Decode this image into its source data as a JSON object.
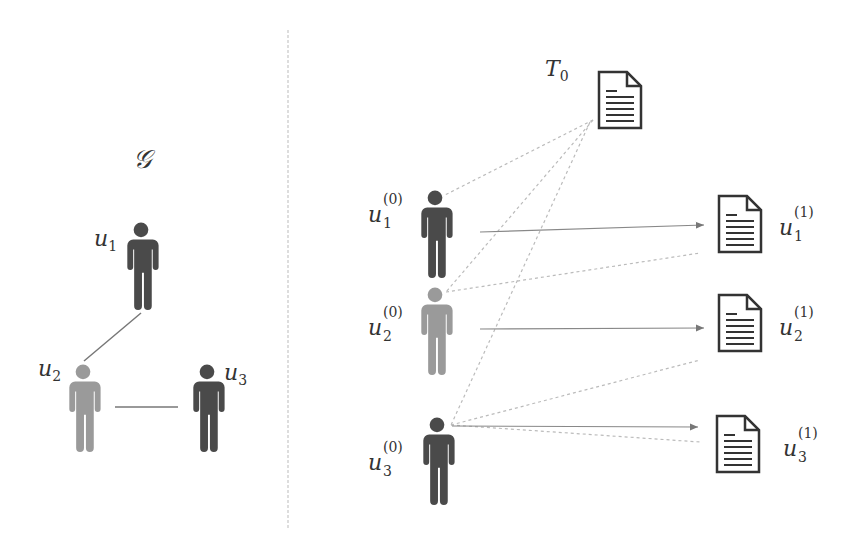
{
  "left_panel": {
    "graph_label": "𝒢",
    "nodes": [
      {
        "id": "u1",
        "label": "u",
        "sub": "1",
        "color": "#4a4a4a"
      },
      {
        "id": "u2",
        "label": "u",
        "sub": "2",
        "color": "#9a9a9a"
      },
      {
        "id": "u3",
        "label": "u",
        "sub": "3",
        "color": "#4a4a4a"
      }
    ],
    "edges": [
      [
        "u1",
        "u2"
      ],
      [
        "u2",
        "u3"
      ]
    ]
  },
  "right_panel": {
    "template_doc": {
      "label": "T",
      "sub": "0"
    },
    "inputs": [
      {
        "label": "u",
        "sub": "1",
        "sup": "(0)",
        "color": "#4a4a4a"
      },
      {
        "label": "u",
        "sub": "2",
        "sup": "(0)",
        "color": "#9a9a9a"
      },
      {
        "label": "u",
        "sub": "3",
        "sup": "(0)",
        "color": "#4a4a4a"
      }
    ],
    "outputs": [
      {
        "label": "u",
        "sub": "1",
        "sup": "(1)"
      },
      {
        "label": "u",
        "sub": "2",
        "sup": "(1)"
      },
      {
        "label": "u",
        "sub": "3",
        "sup": "(1)"
      }
    ]
  },
  "colors": {
    "dark": "#4a4a4a",
    "light": "#9a9a9a",
    "line": "#888888",
    "dash": "#bbbbbb"
  }
}
